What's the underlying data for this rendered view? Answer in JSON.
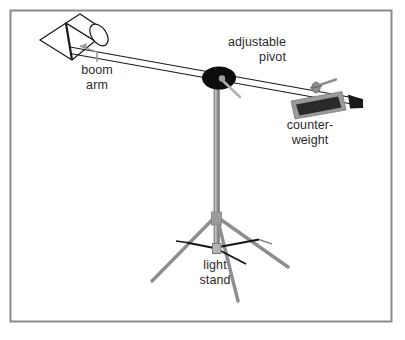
{
  "figure": {
    "kind": "technical-line-diagram",
    "background_color": "#ffffff",
    "frame": {
      "name": "diagram-border",
      "color": "#8a8a8a",
      "x": 10.5,
      "y": 10.5,
      "width": 381,
      "height": 311,
      "stroke_width": 2
    }
  },
  "labels": {
    "boom_arm": {
      "line1": "boom",
      "line2": "arm",
      "x": 97,
      "y": 74,
      "anchor": "middle"
    },
    "adjustable_pivot": {
      "line1": "adjustable",
      "line2": "pivot",
      "x": 285,
      "y": 46,
      "anchor": "end"
    },
    "counterweight": {
      "line1": "counter-",
      "line2": "weight",
      "x": 310,
      "y": 129,
      "anchor": "middle"
    },
    "light_stand": {
      "line1": "light",
      "line2": "stand",
      "x": 215,
      "y": 269,
      "anchor": "middle"
    }
  },
  "colors": {
    "ink": "#1a1a1a",
    "text": "#2b2b2b",
    "frame": "#8a8a8a",
    "metal_gray": "#8e8e8e",
    "metal_light": "#b9b9b9",
    "metal_dark": "#6f6f6f",
    "pivot_black": "#0d0d0d",
    "counterweight_body": "#2a2a2a",
    "counterweight_edge": "#9a9a9a",
    "leader_gray": "#9a9a9a",
    "white": "#ffffff"
  },
  "parts": {
    "light_head": {
      "name": "light-head",
      "description": "tapered cylinder lamp housing at upper-left with elliptical front opening",
      "body_points": "40,40 66,23 95,41 72,60",
      "barrel_points": "66,23 80,15 103,31 95,41",
      "front_ellipse": {
        "cx": 91,
        "cy": 24,
        "rx": 8,
        "ry": 12,
        "rotation": -32
      },
      "band_line": "66,23 72,60"
    },
    "boom_arm": {
      "name": "boom-arm",
      "description": "long thin double-line tube from light head down to right past pivot",
      "line_top": "71,47 362,99",
      "line_bottom": "70,53 362,105",
      "stroke_width": 1.1
    },
    "pivot": {
      "name": "adjustable-pivot",
      "description": "black elliptical hub clamping boom to column with small tilt knob",
      "ellipse": {
        "cx": 219,
        "cy": 78,
        "rx": 17,
        "ry": 11
      },
      "inner_dot": {
        "cx": 222,
        "cy": 79,
        "r": 3
      },
      "knob_handle": "223,80 240,97",
      "knob_tip": {
        "cx": 240,
        "cy": 97,
        "r": 3
      }
    },
    "column": {
      "name": "stand-column",
      "description": "vertical gray telescoping post from pivot down to base hub",
      "x": 216,
      "top": 80,
      "bottom": 252,
      "width": 6
    },
    "counterweight": {
      "name": "counterweight",
      "description": "dark rectangular weight block clamped on right side of boom",
      "block_points": "292,101 341,92 345,109 296,118",
      "inner_points": "297,104 338,96 341,107 300,115",
      "clamp_knob": {
        "cx": 316,
        "cy": 87,
        "rx": 4,
        "ry": 5
      },
      "clamp_handle": "318,86 334,80",
      "end_cap_points": "349,95 362,99 362,108 351,108"
    },
    "tripod": {
      "name": "tripod-legs",
      "collar": {
        "cx": 216,
        "cy": 218,
        "width": 9,
        "height": 12
      },
      "hub": {
        "cx": 216,
        "cy": 248,
        "width": 8,
        "height": 9
      },
      "legs": [
        {
          "name": "tripod-leg-left",
          "path": "214,219 152,281"
        },
        {
          "name": "tripod-leg-right",
          "path": "219,219 287,267"
        },
        {
          "name": "tripod-leg-front",
          "path": "218,220 237,300"
        }
      ],
      "braces": [
        {
          "name": "tripod-brace-left",
          "path": "213,248 187,243"
        },
        {
          "name": "tripod-brace-right",
          "path": "219,247 258,240"
        },
        {
          "name": "tripod-brace-front",
          "path": "219,249 245,263"
        }
      ]
    },
    "leader_lines": [
      {
        "name": "leader-boom-arm",
        "path": "97,63 97,52 81,46",
        "color": "#9a9a9a"
      }
    ]
  }
}
